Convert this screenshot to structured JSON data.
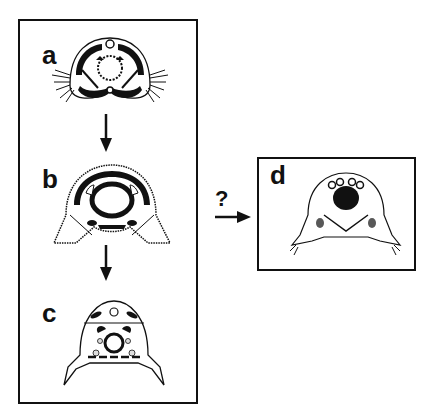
{
  "figure": {
    "panels": [
      {
        "id": "a",
        "label": "a"
      },
      {
        "id": "b",
        "label": "b"
      },
      {
        "id": "c",
        "label": "c"
      },
      {
        "id": "d",
        "label": "d"
      }
    ],
    "transition_marker": "?",
    "colors": {
      "ink": "#111111",
      "background": "#ffffff"
    }
  }
}
